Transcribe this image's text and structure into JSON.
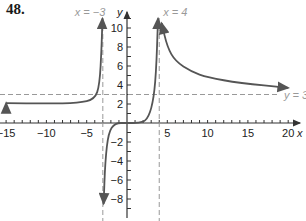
{
  "problem_number": "48.",
  "chart_data": {
    "type": "line",
    "title": "",
    "xlabel": "x",
    "ylabel": "y",
    "xlim": [
      -15,
      21
    ],
    "ylim": [
      -8.5,
      11
    ],
    "x_ticks": [
      -15,
      -10,
      -5,
      5,
      10,
      15,
      20
    ],
    "x_tick_labels": [
      "−15",
      "−10",
      "−5",
      "5",
      "10",
      "15",
      "20"
    ],
    "y_ticks": [
      -8,
      -6,
      -4,
      -2,
      2,
      4,
      6,
      8,
      10
    ],
    "y_tick_labels": [
      "−8",
      "−6",
      "−4",
      "−2",
      "2",
      "4",
      "6",
      "8",
      "10"
    ],
    "asymptotes": {
      "vertical": [
        {
          "x": -3,
          "label": "x = −3"
        },
        {
          "x": 4,
          "label": "x = 4"
        }
      ],
      "horizontal": [
        {
          "y": 3,
          "label": "y = 3"
        }
      ]
    },
    "series": [
      {
        "name": "left-branch",
        "points": [
          [
            -15,
            2.1
          ],
          [
            -10,
            2.05
          ],
          [
            -6,
            2.1
          ],
          [
            -4,
            2.5
          ],
          [
            -3.4,
            4
          ],
          [
            -3.15,
            8
          ],
          [
            -3.05,
            11
          ]
        ]
      },
      {
        "name": "middle-branch",
        "points": [
          [
            -2.9,
            -8.5
          ],
          [
            -2.7,
            -4
          ],
          [
            -2.3,
            -1
          ],
          [
            -1.5,
            0
          ],
          [
            0,
            0
          ],
          [
            1.5,
            0
          ],
          [
            2.5,
            0.3
          ],
          [
            3.2,
            2
          ],
          [
            3.6,
            5
          ],
          [
            3.85,
            11
          ]
        ]
      },
      {
        "name": "right-branch",
        "points": [
          [
            4.3,
            10.5
          ],
          [
            5,
            8
          ],
          [
            6,
            6.5
          ],
          [
            8,
            5.4
          ],
          [
            10,
            4.8
          ],
          [
            14,
            4.2
          ],
          [
            20,
            3.7
          ]
        ]
      }
    ],
    "grid": false,
    "legend": null,
    "colors": {
      "curve": "#555555",
      "asymptote": "#999999",
      "axis": "#333333",
      "text": "#222222"
    }
  }
}
